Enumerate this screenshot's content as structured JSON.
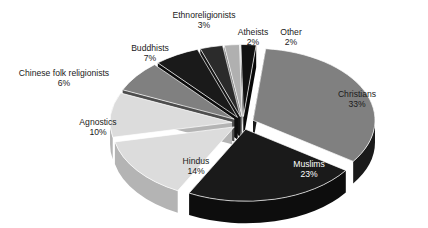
{
  "chart_data": {
    "type": "pie",
    "title": "",
    "subtitle": "",
    "xlabel": "",
    "ylabel": "",
    "legend_position": "none",
    "grid": false,
    "exploded": true,
    "three_d": true,
    "unit": "%",
    "categories": [
      "Christians",
      "Muslims",
      "Hindus",
      "Agnostics",
      "Buddhists",
      "Chinese folk religionists",
      "Ethnoreligionists",
      "Atheists",
      "Other"
    ],
    "values": [
      33,
      23,
      14,
      10,
      7,
      6,
      3,
      2,
      2
    ],
    "slices": [
      {
        "label": "Christians",
        "value": 33,
        "value_text": "33%",
        "top_color": "#808080",
        "side_color": "#1a1a1a",
        "label_placement": "inside",
        "label_style": "inside-light",
        "label_x": 357,
        "label_y": 100
      },
      {
        "label": "Muslims",
        "value": 23,
        "value_text": "23%",
        "top_color": "#1a1a1a",
        "side_color": "#0d0d0d",
        "label_placement": "inside",
        "label_style": "inside-dark",
        "label_x": 309,
        "label_y": 170
      },
      {
        "label": "Hindus",
        "value": 14,
        "value_text": "14%",
        "top_color": "#dcdcdc",
        "side_color": "#b4b4b4",
        "label_placement": "inside",
        "label_style": "inside-light",
        "label_y": 167,
        "label_x": 196
      },
      {
        "label": "Agnostics",
        "value": 10,
        "value_text": "10%",
        "top_color": "#dcdcdc",
        "side_color": "#b4b4b4",
        "label_placement": "outside",
        "label_style": "",
        "label_x": 98,
        "label_y": 128
      },
      {
        "label": "Buddhists",
        "value": 7,
        "value_text": "7%",
        "top_color": "#808080",
        "side_color": "#4d4d4d",
        "label_placement": "outside",
        "label_style": "",
        "label_x": 150,
        "label_y": 54
      },
      {
        "label": "Chinese folk religionists",
        "value": 6,
        "value_text": "6%",
        "top_color": "#1a1a1a",
        "side_color": "#0d0d0d",
        "label_placement": "outside",
        "label_style": "",
        "label_x": 64,
        "label_y": 79
      },
      {
        "label": "Ethnoreligionists",
        "value": 3,
        "value_text": "3%",
        "top_color": "#2b2b2b",
        "side_color": "#141414",
        "label_placement": "outside",
        "label_style": "",
        "label_x": 204,
        "label_y": 21
      },
      {
        "label": "Atheists",
        "value": 2,
        "value_text": "2%",
        "top_color": "#b0b0b0",
        "side_color": "#7a7a7a",
        "label_placement": "outside",
        "label_style": "",
        "label_x": 253,
        "label_y": 38
      },
      {
        "label": "Other",
        "value": 2,
        "value_text": "2%",
        "top_color": "#121212",
        "side_color": "#080808",
        "label_placement": "outside",
        "label_style": "",
        "label_x": 291,
        "label_y": 38
      }
    ],
    "geometry": {
      "center_x": 243,
      "center_y": 123,
      "radius_x": 122,
      "radius_y": 72,
      "depth": 22,
      "start_angle_deg": -84,
      "explode_offset": 11
    }
  }
}
